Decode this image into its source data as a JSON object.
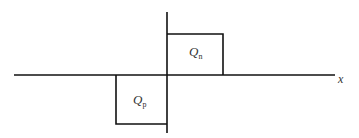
{
  "diagram": {
    "x_axis_label": "x",
    "regions": [
      {
        "id": "qn",
        "symbol": "Q",
        "subscript": "n",
        "side": "positive-x",
        "direction": "above-axis"
      },
      {
        "id": "qp",
        "symbol": "Q",
        "subscript": "p",
        "side": "negative-x",
        "direction": "below-axis"
      }
    ],
    "colors": {
      "line": "#111111",
      "text": "#333333",
      "background": "#ffffff"
    }
  }
}
